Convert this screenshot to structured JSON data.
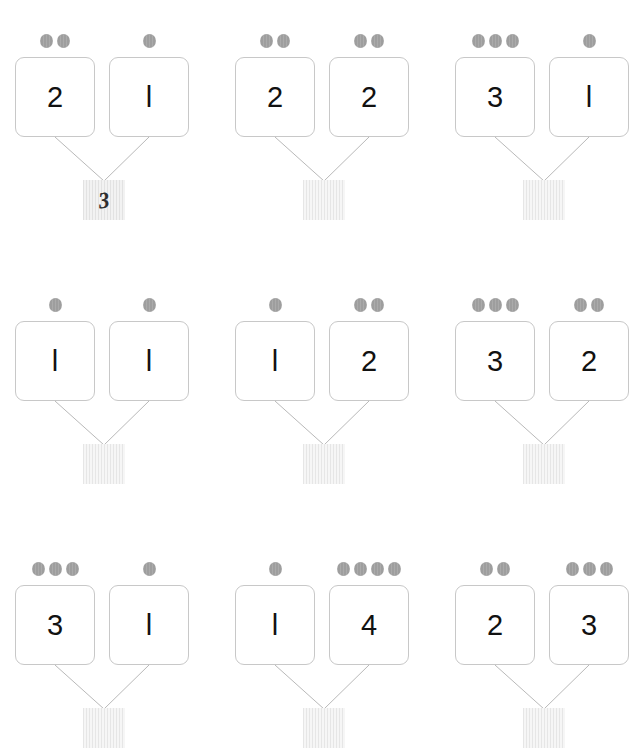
{
  "worksheet": {
    "title": "Number Bond Addition Worksheet",
    "dot_color": "#9e9e9e",
    "box_border_color": "#c8c8c8",
    "connector_color": "#b9b9b9",
    "answer_box_color": "#f0f0f0",
    "digit_color": "#111111"
  },
  "problems": [
    {
      "id": "problem-1",
      "left_dots": 2,
      "right_dots": 1,
      "left_value": "2",
      "right_value": "l",
      "answer": "3",
      "answer_filled": true
    },
    {
      "id": "problem-2",
      "left_dots": 2,
      "right_dots": 2,
      "left_value": "2",
      "right_value": "2",
      "answer": "",
      "answer_filled": false
    },
    {
      "id": "problem-3",
      "left_dots": 3,
      "right_dots": 1,
      "left_value": "3",
      "right_value": "l",
      "answer": "",
      "answer_filled": false
    },
    {
      "id": "problem-4",
      "left_dots": 1,
      "right_dots": 1,
      "left_value": "l",
      "right_value": "l",
      "answer": "",
      "answer_filled": false
    },
    {
      "id": "problem-5",
      "left_dots": 1,
      "right_dots": 2,
      "left_value": "l",
      "right_value": "2",
      "answer": "",
      "answer_filled": false
    },
    {
      "id": "problem-6",
      "left_dots": 3,
      "right_dots": 2,
      "left_value": "3",
      "right_value": "2",
      "answer": "",
      "answer_filled": false
    },
    {
      "id": "problem-7",
      "left_dots": 3,
      "right_dots": 1,
      "left_value": "3",
      "right_value": "l",
      "answer": "",
      "answer_filled": false
    },
    {
      "id": "problem-8",
      "left_dots": 1,
      "right_dots": 4,
      "left_value": "l",
      "right_value": "4",
      "answer": "",
      "answer_filled": false
    },
    {
      "id": "problem-9",
      "left_dots": 2,
      "right_dots": 3,
      "left_value": "2",
      "right_value": "3",
      "answer": "",
      "answer_filled": false
    }
  ],
  "layout": {
    "columns_x": [
      13,
      233,
      453
    ],
    "rows_y": [
      0,
      264,
      528
    ]
  }
}
